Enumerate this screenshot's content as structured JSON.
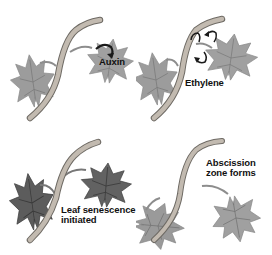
{
  "diagram": {
    "type": "process-stages",
    "colors": {
      "leaf_healthy": "#9a9a9a",
      "leaf_senescent": "#5e5e5e",
      "stem": "#b8b0a6",
      "stem_outline": "#6e6a64",
      "vein": "#6f6f6f",
      "label_text": "#111111",
      "background": "#ffffff"
    },
    "panels": [
      {
        "id": "auxin",
        "position": "top-left",
        "label": "Auxin",
        "icon": "curved-arrow-icon"
      },
      {
        "id": "ethylene",
        "position": "top-right",
        "label": "Ethylene",
        "icon": "curved-arrows-icon"
      },
      {
        "id": "senescence",
        "position": "bottom-left",
        "label_line1": "Leaf senescence",
        "label_line2": "initiated"
      },
      {
        "id": "abscission",
        "position": "bottom-right",
        "label_line1": "Abscission",
        "label_line2": "zone forms"
      }
    ]
  }
}
